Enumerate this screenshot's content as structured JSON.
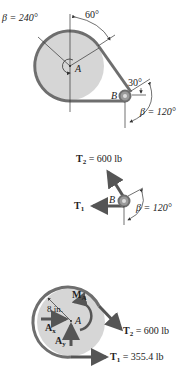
{
  "colors": {
    "pulley_fill": "#d6d6d6",
    "belt": "#6e6e6e",
    "arrow": "#555555",
    "line": "#333333",
    "text": "#222222"
  },
  "figure1": {
    "beta_A": "β = 240°",
    "angle_top": "60°",
    "angle_B": "30°",
    "beta_B": "β = 120°",
    "label_A": "A",
    "label_B": "B"
  },
  "figure2": {
    "T2_label": "T",
    "T2_sub": "2",
    "T2_value": " = 600 lb",
    "T1_label": "T",
    "T1_sub": "1",
    "label_B": "B",
    "beta": "β = 120°"
  },
  "figure3": {
    "MA_label": "M",
    "MA_sub": "A",
    "radius": "8 in.",
    "Ax_label": "A",
    "Ax_sub": "x",
    "Ay_label": "A",
    "Ay_sub": "y",
    "label_A": "A",
    "T2_label": "T",
    "T2_sub": "2",
    "T2_value": " = 600 lb",
    "T1_label": "T",
    "T1_sub": "1",
    "T1_value": " = 355.4 lb"
  }
}
